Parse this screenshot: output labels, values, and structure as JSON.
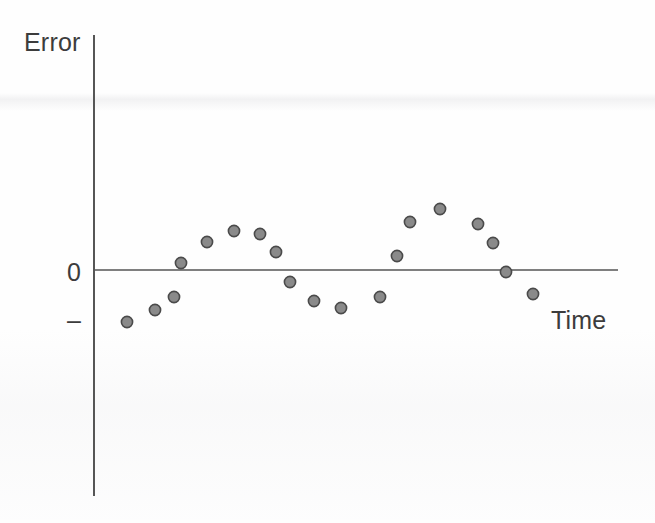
{
  "figure": {
    "background_color": "#fefefe",
    "axis_color": "#4d4d4d",
    "point_fill_color": "#8a8a8a",
    "point_stroke_color": "#4a4a4a"
  },
  "labels": {
    "y_axis": "Error",
    "x_axis": "Time",
    "tick_zero": "0",
    "tick_negative": "–"
  },
  "chart_data": {
    "type": "scatter",
    "title": "",
    "xlabel": "Time",
    "ylabel": "Error",
    "grid": false,
    "legend": null,
    "annotations": [
      "Residual errors plotted against time showing a cyclical (autocorrelated) pattern"
    ],
    "y_tick_labels": [
      "0",
      "–"
    ],
    "y_tick_values": [
      0,
      -1
    ],
    "x_tick_labels": [],
    "xlim": [
      0,
      20
    ],
    "ylim": [
      -1.6,
      3.2
    ],
    "zero_reference_line": 0,
    "series": [
      {
        "name": "Error",
        "marker": "circle",
        "x": [
          1,
          2,
          3,
          4,
          5,
          6,
          7,
          8,
          9,
          10,
          11,
          12,
          13,
          14,
          15,
          16,
          17,
          18,
          19
        ],
        "y": [
          -1.1,
          -0.85,
          -0.55,
          0.15,
          0.6,
          0.83,
          0.75,
          0.37,
          -0.25,
          -0.62,
          -0.75,
          -0.55,
          0.32,
          1.0,
          1.28,
          0.95,
          0.58,
          -0.05,
          -0.5
        ]
      }
    ],
    "points_px": [
      {
        "x": 127,
        "y": 322
      },
      {
        "x": 155,
        "y": 310
      },
      {
        "x": 174,
        "y": 297
      },
      {
        "x": 181,
        "y": 263
      },
      {
        "x": 207,
        "y": 242
      },
      {
        "x": 234,
        "y": 231
      },
      {
        "x": 260,
        "y": 234
      },
      {
        "x": 276,
        "y": 252
      },
      {
        "x": 290,
        "y": 282
      },
      {
        "x": 314,
        "y": 301
      },
      {
        "x": 341,
        "y": 308
      },
      {
        "x": 380,
        "y": 297
      },
      {
        "x": 397,
        "y": 256
      },
      {
        "x": 410,
        "y": 222
      },
      {
        "x": 440,
        "y": 209
      },
      {
        "x": 478,
        "y": 224
      },
      {
        "x": 493,
        "y": 243
      },
      {
        "x": 506,
        "y": 272
      },
      {
        "x": 533,
        "y": 294
      }
    ],
    "axes_px": {
      "y_axis_x": 94,
      "y_axis_top": 35,
      "y_axis_bottom": 496,
      "zero_line_y": 270,
      "zero_line_left": 94,
      "zero_line_right": 618
    },
    "point_radius_px": 5.6
  }
}
